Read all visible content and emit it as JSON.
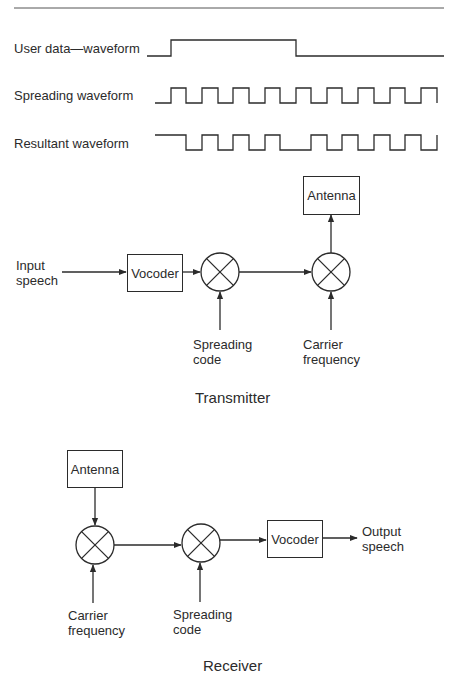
{
  "header": {
    "rule": true
  },
  "waveforms": {
    "rows": [
      {
        "id": "user-data",
        "label": "User data—waveform",
        "bits": [
          0,
          1,
          0
        ],
        "description": "Low, then high for ~4 chips, then low"
      },
      {
        "id": "spreading",
        "label": "Spreading waveform",
        "chips": [
          0,
          1,
          0,
          1,
          0,
          1,
          0,
          1,
          0,
          1,
          0,
          1,
          0,
          1,
          0,
          1,
          0,
          1
        ]
      },
      {
        "id": "resultant",
        "label": "Resultant waveform",
        "chips": [
          1,
          0,
          1,
          0,
          1,
          0,
          1,
          0,
          0,
          1,
          0,
          1,
          0,
          1,
          0,
          1,
          0,
          1
        ]
      }
    ]
  },
  "transmitter": {
    "caption": "Transmitter",
    "input_label_line1": "Input",
    "input_label_line2": "speech",
    "vocoder_label": "Vocoder",
    "antenna_label": "Antenna",
    "spreading_label_line1": "Spreading",
    "spreading_label_line2": "code",
    "carrier_label_line1": "Carrier",
    "carrier_label_line2": "frequency",
    "flow": [
      "Input speech",
      "Vocoder",
      "Mixer (x Spreading code)",
      "Mixer (x Carrier frequency)",
      "Antenna"
    ]
  },
  "receiver": {
    "caption": "Receiver",
    "antenna_label": "Antenna",
    "vocoder_label": "Vocoder",
    "output_label_line1": "Output",
    "output_label_line2": "speech",
    "carrier_label_line1": "Carrier",
    "carrier_label_line2": "frequency",
    "spreading_label_line1": "Spreading",
    "spreading_label_line2": "code",
    "flow": [
      "Antenna",
      "Mixer (x Carrier frequency)",
      "Mixer (x Spreading code)",
      "Vocoder",
      "Output speech"
    ]
  },
  "colors": {
    "ink": "#2b2b2b",
    "background": "#ffffff"
  }
}
